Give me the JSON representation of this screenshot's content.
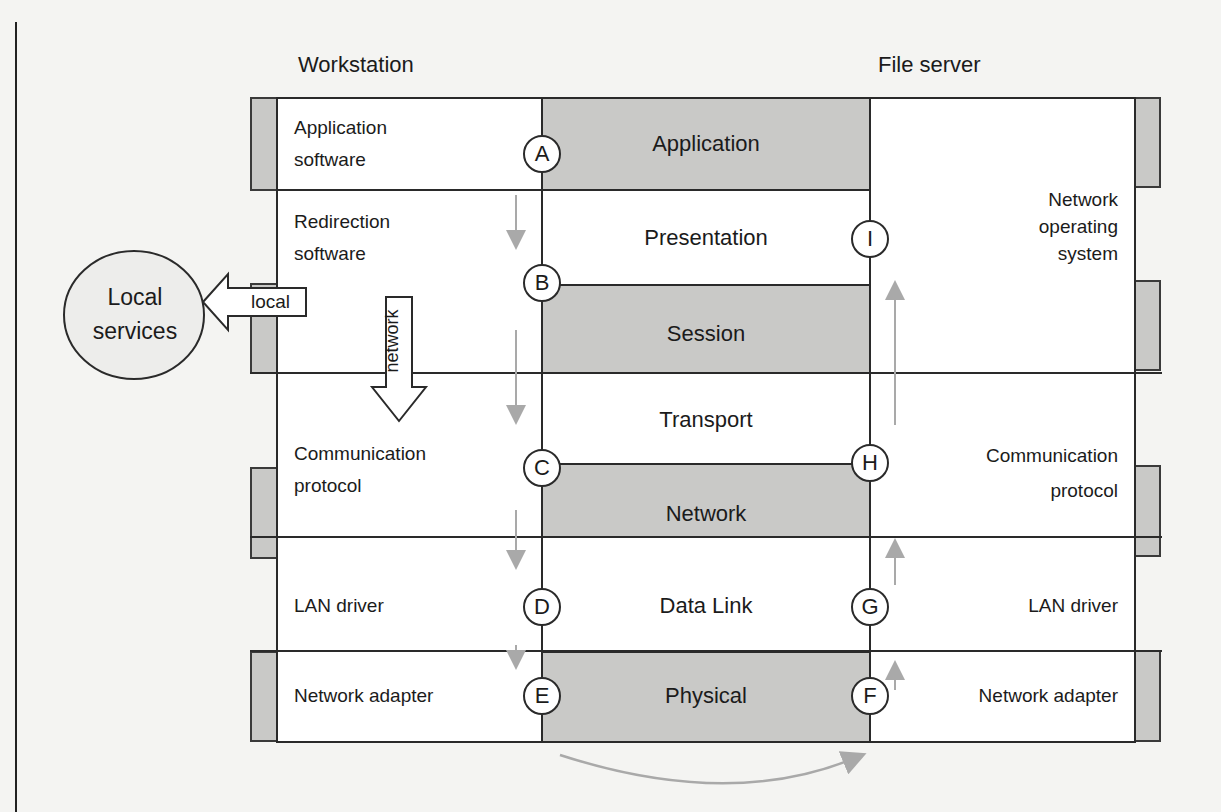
{
  "diagram": {
    "headings": {
      "workstation": "Workstation",
      "file_server": "File server"
    },
    "osi_layers": [
      {
        "name": "Application",
        "shaded": true
      },
      {
        "name": "Presentation",
        "shaded": false
      },
      {
        "name": "Session",
        "shaded": true
      },
      {
        "name": "Transport",
        "shaded": false
      },
      {
        "name": "Network",
        "shaded": true
      },
      {
        "name": "Data Link",
        "shaded": false
      },
      {
        "name": "Physical",
        "shaded": true
      }
    ],
    "workstation_components": [
      {
        "line1": "Application",
        "line2": "software"
      },
      {
        "line1": "Redirection",
        "line2": "software"
      },
      {
        "line1": "Communication",
        "line2": "protocol"
      },
      {
        "line1": "LAN driver"
      },
      {
        "line1": "Network adapter"
      }
    ],
    "file_server_components": [
      {
        "line1": "Network",
        "line2": "operating",
        "line3": "system"
      },
      {
        "line1": "Communication",
        "line2": "protocol"
      },
      {
        "line1": "LAN driver"
      },
      {
        "line1": "Network adapter"
      }
    ],
    "nodes": {
      "workstation": [
        "A",
        "B",
        "C",
        "D",
        "E"
      ],
      "file_server": [
        "F",
        "G",
        "H",
        "I"
      ]
    },
    "local_services": {
      "line1": "Local",
      "line2": "services"
    },
    "arrows": {
      "local": "local",
      "network": "network"
    },
    "colors": {
      "shade": "#c9c9c7",
      "line": "#2a2a2a",
      "flow_arrow": "#a9a9a9",
      "background": "#f4f4f2"
    }
  }
}
